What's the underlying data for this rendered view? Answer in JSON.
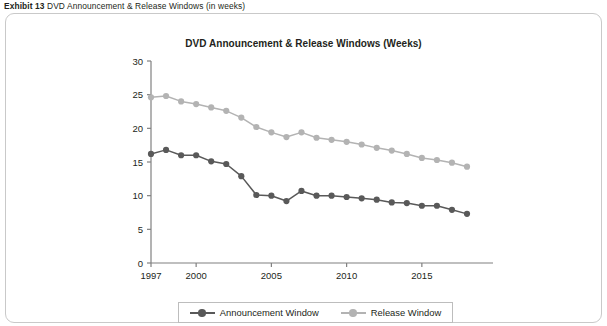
{
  "exhibit": {
    "label": "Exhibit 13",
    "text": "DVD Announcement & Release Windows (in weeks)"
  },
  "chart_card": {
    "border_color": "#c9c9c9"
  },
  "legend": {
    "position": "bottom-center",
    "entries": [
      {
        "name": "Announcement Window",
        "color": "#595959"
      },
      {
        "name": "Release Window",
        "color": "#b3b3b3"
      }
    ]
  },
  "chart_data": {
    "type": "line",
    "title": "DVD Announcement & Release Windows (Weeks)",
    "xlabel": "",
    "ylabel": "",
    "ylim": [
      0,
      30
    ],
    "yticks": [
      0,
      5,
      10,
      15,
      20,
      25,
      30
    ],
    "xlim": [
      1997,
      2018
    ],
    "xticks": [
      1997,
      2000,
      2005,
      2010,
      2015
    ],
    "xtick_labels": [
      "1997",
      "2000",
      "2005",
      "2010",
      "2015"
    ],
    "grid": false,
    "x": [
      1997,
      1998,
      1999,
      2000,
      2001,
      2002,
      2003,
      2004,
      2005,
      2006,
      2007,
      2008,
      2009,
      2010,
      2011,
      2012,
      2013,
      2014,
      2015,
      2016,
      2017,
      2018
    ],
    "series": [
      {
        "name": "Announcement Window",
        "color": "#595959",
        "values": [
          16.2,
          16.8,
          16.0,
          16.0,
          15.1,
          14.7,
          12.9,
          10.1,
          10.0,
          9.2,
          10.7,
          10.0,
          10.0,
          9.8,
          9.6,
          9.4,
          9.0,
          8.9,
          8.5,
          8.5,
          7.9,
          7.3
        ]
      },
      {
        "name": "Release Window",
        "color": "#b3b3b3",
        "values": [
          24.6,
          24.8,
          24.0,
          23.6,
          23.1,
          22.6,
          21.6,
          20.2,
          19.4,
          18.7,
          19.4,
          18.6,
          18.3,
          18.0,
          17.6,
          17.1,
          16.7,
          16.2,
          15.6,
          15.3,
          14.9,
          14.3
        ]
      }
    ]
  }
}
